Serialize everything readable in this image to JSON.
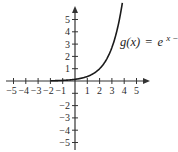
{
  "chart_data": {
    "type": "line",
    "title": "",
    "function_label": {
      "name": "g(x)",
      "equals": "=",
      "base": "e",
      "exponent": "x − 2",
      "full": "g(x) = e^(x−2)"
    },
    "xlabel": "",
    "ylabel": "",
    "xlim": [
      -5.3,
      6
    ],
    "ylim": [
      -5.8,
      6.2
    ],
    "x_ticks": [
      -5,
      -4,
      -3,
      -2,
      -1,
      1,
      2,
      3,
      4,
      5
    ],
    "x_tick_labels": [
      "−5",
      "−4",
      "−3",
      "−2",
      "−1",
      "1",
      "2",
      "3",
      "4",
      "5"
    ],
    "y_ticks": [
      -5,
      -4,
      -3,
      -2,
      -1,
      1,
      2,
      3,
      4,
      5
    ],
    "y_tick_labels": [
      "−5",
      "−4",
      "−3",
      "−2",
      "",
      "1",
      "2",
      "3",
      "4",
      "5"
    ],
    "grid": false,
    "legend": "none",
    "series": [
      {
        "name": "g(x) = e^(x−2)",
        "x": [
          -2,
          -1,
          0,
          0.5,
          1,
          1.5,
          2,
          2.5,
          3,
          3.25,
          3.5,
          3.75,
          3.86
        ],
        "y": [
          0.018,
          0.05,
          0.135,
          0.223,
          0.368,
          0.607,
          1.0,
          1.649,
          2.718,
          3.49,
          4.48,
          5.75,
          6.42
        ],
        "color": "#1a1a1a"
      }
    ],
    "axis_color": "#333333"
  }
}
